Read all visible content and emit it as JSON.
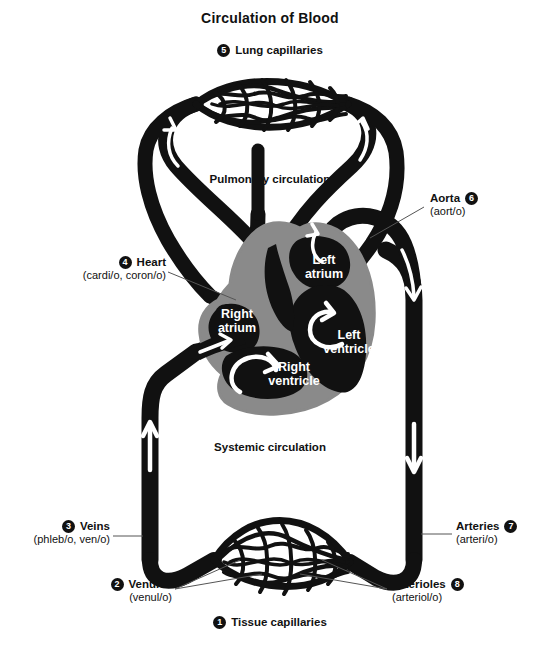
{
  "title": "Circulation of Blood",
  "regions": {
    "pulmonary": "Pulmonary circulation",
    "systemic": "Systemic circulation"
  },
  "heart_chambers": [
    {
      "name": "right-atrium",
      "label_line1": "Right",
      "label_line2": "atrium"
    },
    {
      "name": "left-atrium",
      "label_line1": "Left",
      "label_line2": "atrium"
    },
    {
      "name": "right-ventricle",
      "label_line1": "Right",
      "label_line2": "ventricle"
    },
    {
      "name": "left-ventricle",
      "label_line1": "Left",
      "label_line2": "ventricle"
    }
  ],
  "callouts": [
    {
      "number": "1",
      "term": "Tissue capillaries",
      "root": ""
    },
    {
      "number": "2",
      "term": "Venules",
      "root": "(venul/o)"
    },
    {
      "number": "3",
      "term": "Veins",
      "root": "(phleb/o, ven/o)"
    },
    {
      "number": "4",
      "term": "Heart",
      "root": "(cardi/o, coron/o)"
    },
    {
      "number": "5",
      "term": "Lung capillaries",
      "root": ""
    },
    {
      "number": "6",
      "term": "Aorta",
      "root": "(aort/o)"
    },
    {
      "number": "7",
      "term": "Arteries",
      "root": "(arteri/o)"
    },
    {
      "number": "8",
      "term": "Arterioles",
      "root": "(arteriol/o)"
    }
  ],
  "colors": {
    "vessel": "#111111",
    "heart_wall": "#8a8a8a",
    "chamber": "#111111",
    "arrow": "#ffffff",
    "background": "#ffffff",
    "text": "#111111",
    "leader_line": "#555555"
  }
}
